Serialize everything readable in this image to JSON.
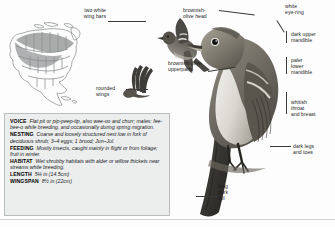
{
  "page": {
    "species_illustration": "Alder Flycatcher field-guide plate",
    "background_color": "#fdfdfd"
  },
  "range_map": {
    "name": "North America range map",
    "regions": [
      {
        "label": "breeding range",
        "color": "#8d8d8d"
      },
      {
        "label": "non-breeding / absent",
        "color": "#ffffff"
      }
    ],
    "outline_color": "#8a8d8e"
  },
  "annotations": [
    {
      "id": "two-white-wing-bars",
      "text": "two white\nwing bars"
    },
    {
      "id": "rounded-wings",
      "text": "rounded\nwings"
    },
    {
      "id": "brownish-olive-head",
      "text": "brownish-\nolive head"
    },
    {
      "id": "brownish-olive-upperparts",
      "text": "brownish-olive\nupperparts"
    },
    {
      "id": "white-eye-ring",
      "text": "white\neye-ring"
    },
    {
      "id": "dark-upper-mandible",
      "text": "dark upper\nmandible"
    },
    {
      "id": "paler-lower-mandible",
      "text": "paler\nlower\nmandible"
    },
    {
      "id": "whitish-throat-and-breast",
      "text": "whitish\nthroat\nand breast"
    },
    {
      "id": "dark-legs-and-toes",
      "text": "dark legs\nand toes"
    },
    {
      "id": "long-dark-tail",
      "text": "long\ndark\ntail"
    }
  ],
  "info_panel": {
    "background_color": "#eceded",
    "border_color": "#b9bcbd",
    "entries": [
      {
        "label": "VOICE",
        "text": "Flat pit or pip-peep-tip, also wee-oo and churr; males: fee-bee-o while breeding, and occasionally during spring migration."
      },
      {
        "label": "NESTING",
        "text": "Coarse and loosely structured nest low in fork of deciduous shrub; 3–4 eggs; 1 brood; Jun–Jul."
      },
      {
        "label": "FEEDING",
        "text": "Mostly insects, caught mainly in flight or from foliage; fruit in winter."
      },
      {
        "label": "HABITAT",
        "text": "Wet shrubby habitats with alder or willow thickets near streams while breeding."
      }
    ],
    "measurements": [
      {
        "label": "LENGTH",
        "value": "5¼ in (14.5cm)"
      },
      {
        "label": "WINGSPAN",
        "value": "8½ in (22cm)"
      }
    ]
  }
}
